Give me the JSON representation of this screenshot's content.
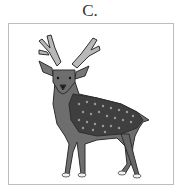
{
  "option": {
    "label": "C.",
    "image": {
      "subject": "deer",
      "description": "Stylized illustration of a spotted stag with antlers, standing, facing viewer",
      "icon": "deer-illustration"
    }
  },
  "colors": {
    "border": "#bdbdbd",
    "body": "#6e6e6e",
    "back": "#3f3f3f",
    "spots": "#9a9a9a",
    "antlers": "#b8b8b8",
    "outline": "#2e2e2e",
    "hooves": "#f2f2f2"
  }
}
